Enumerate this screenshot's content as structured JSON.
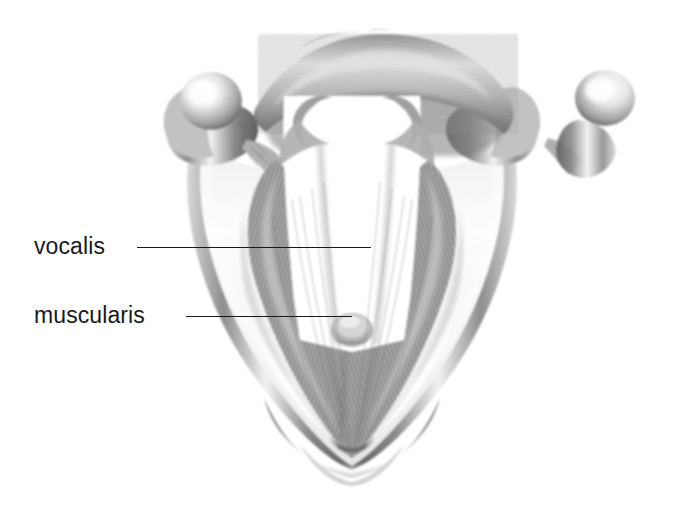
{
  "figure": {
    "background_color": "#ffffff",
    "ink_color": "#1a1a1a",
    "style": "grayscale airbrush anatomical illustration"
  },
  "labels": [
    {
      "id": "vocalis",
      "text": "vocalis",
      "x": 34,
      "y": 235,
      "leader": {
        "x1": 137,
        "y1": 247,
        "x2": 371,
        "y2": 247
      }
    },
    {
      "id": "muscularis",
      "text": "muscularis",
      "x": 34,
      "y": 304,
      "leader": {
        "x1": 186,
        "y1": 316,
        "x2": 352,
        "y2": 316
      }
    }
  ],
  "anatomy": {
    "glottis_color": "#ffffff",
    "cartilage_tone": "#b8b8b8",
    "muscle_tone": "#9a9a9a",
    "shadow_tone": "#4f4f4f",
    "parts": [
      "thyroid-cartilage-lamina-left",
      "thyroid-cartilage-lamina-right",
      "superior-horn-knob-left",
      "superior-horn-knob-right",
      "posterior-arch",
      "arytenoid-vocal-process-left",
      "arytenoid-vocal-process-right",
      "vocalis-muscle-left",
      "vocalis-muscle-right",
      "muscularis-muscle-left",
      "muscularis-muscle-right",
      "anterior-commissure",
      "glottis-airway"
    ]
  }
}
